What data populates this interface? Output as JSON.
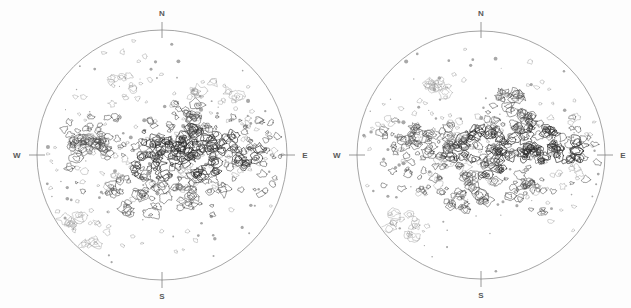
{
  "figure": {
    "background_color": "#fdfdfd",
    "width": 631,
    "height": 308
  },
  "panels": [
    {
      "id": "left-disk",
      "name": "Left solar disk",
      "center_x": 162,
      "center_y": 155,
      "radius": 125,
      "cardinals": {
        "north": "N",
        "south": "S",
        "east": "E",
        "west": "W"
      },
      "outline_color": "#8e8e8e",
      "contour_color": "#4a4a4a"
    },
    {
      "id": "right-disk",
      "name": "Right solar disk",
      "center_x": 166,
      "center_y": 155,
      "radius": 124,
      "cardinals": {
        "north": "N",
        "south": "S",
        "east": "E",
        "west": "W"
      },
      "outline_color": "#8e8e8e",
      "contour_color": "#4a4a4a"
    }
  ],
  "chart_data": {
    "type": "contour",
    "subtitle": "",
    "xlabel": "",
    "ylabel": "",
    "grid": false,
    "legend": null,
    "panel_count": 2,
    "projection": "orthographic solar disk",
    "axis_labels": [
      "N",
      "E",
      "S",
      "W"
    ],
    "panels": [
      {
        "name": "left-disk",
        "limb_labels": {
          "top": "N",
          "bottom": "S",
          "left": "W",
          "right": "E"
        },
        "cluster_density": "high",
        "clusters": [
          {
            "cx": 0.46,
            "cy": 0.5,
            "r": 0.13,
            "n": 34,
            "weight": "strong"
          },
          {
            "cx": 0.68,
            "cy": 0.49,
            "r": 0.14,
            "n": 40,
            "weight": "strong"
          },
          {
            "cx": 0.24,
            "cy": 0.46,
            "r": 0.11,
            "n": 22,
            "weight": "medium"
          },
          {
            "cx": 0.58,
            "cy": 0.36,
            "r": 0.11,
            "n": 20,
            "weight": "medium"
          },
          {
            "cx": 0.83,
            "cy": 0.5,
            "r": 0.07,
            "n": 10,
            "weight": "strong"
          },
          {
            "cx": 0.4,
            "cy": 0.66,
            "r": 0.12,
            "n": 20,
            "weight": "medium"
          },
          {
            "cx": 0.66,
            "cy": 0.66,
            "r": 0.12,
            "n": 18,
            "weight": "medium"
          },
          {
            "cx": 0.18,
            "cy": 0.8,
            "r": 0.1,
            "n": 14,
            "weight": "faint"
          },
          {
            "cx": 0.34,
            "cy": 0.24,
            "r": 0.1,
            "n": 9,
            "weight": "faint"
          },
          {
            "cx": 0.72,
            "cy": 0.26,
            "r": 0.09,
            "n": 8,
            "weight": "faint"
          }
        ]
      },
      {
        "name": "right-disk",
        "limb_labels": {
          "top": "N",
          "bottom": "S",
          "left": "W",
          "right": "E"
        },
        "cluster_density": "high",
        "clusters": [
          {
            "cx": 0.5,
            "cy": 0.49,
            "r": 0.14,
            "n": 34,
            "weight": "strong"
          },
          {
            "cx": 0.7,
            "cy": 0.45,
            "r": 0.12,
            "n": 32,
            "weight": "strong"
          },
          {
            "cx": 0.3,
            "cy": 0.44,
            "r": 0.11,
            "n": 20,
            "weight": "medium"
          },
          {
            "cx": 0.62,
            "cy": 0.33,
            "r": 0.12,
            "n": 22,
            "weight": "medium"
          },
          {
            "cx": 0.86,
            "cy": 0.48,
            "r": 0.07,
            "n": 12,
            "weight": "strong"
          },
          {
            "cx": 0.45,
            "cy": 0.64,
            "r": 0.12,
            "n": 20,
            "weight": "medium"
          },
          {
            "cx": 0.7,
            "cy": 0.66,
            "r": 0.11,
            "n": 16,
            "weight": "medium"
          },
          {
            "cx": 0.2,
            "cy": 0.78,
            "r": 0.09,
            "n": 12,
            "weight": "faint"
          },
          {
            "cx": 0.16,
            "cy": 0.44,
            "r": 0.08,
            "n": 12,
            "weight": "medium"
          },
          {
            "cx": 0.36,
            "cy": 0.22,
            "r": 0.09,
            "n": 8,
            "weight": "faint"
          }
        ]
      }
    ]
  }
}
